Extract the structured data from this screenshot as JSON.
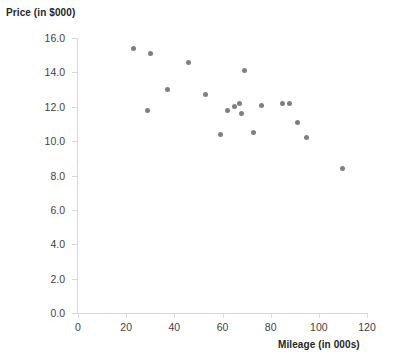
{
  "chart_data": {
    "type": "scatter",
    "title": "",
    "xlabel": "Mileage (in 000s)",
    "ylabel": "Price (in $000)",
    "xlim": [
      0,
      120
    ],
    "ylim": [
      0.0,
      16.0
    ],
    "xticks": [
      "0",
      "20",
      "40",
      "60",
      "80",
      "100",
      "120"
    ],
    "xtick_values": [
      0,
      20,
      40,
      60,
      80,
      100,
      120
    ],
    "yticks": [
      "0.0",
      "2.0",
      "4.0",
      "6.0",
      "8.0",
      "10.0",
      "12.0",
      "14.0",
      "16.0"
    ],
    "ytick_values": [
      0.0,
      2.0,
      4.0,
      6.0,
      8.0,
      10.0,
      12.0,
      14.0,
      16.0
    ],
    "grid": false,
    "legend": false,
    "marker_color": "#7f7f7f",
    "axis_color": "#d9d9d9",
    "series": [
      {
        "name": "Used cars",
        "x": [
          23,
          30,
          29,
          37,
          46,
          53,
          59,
          62,
          65,
          67,
          68,
          69,
          73,
          76,
          85,
          88,
          91,
          95,
          110
        ],
        "y": [
          15.4,
          15.1,
          11.8,
          13.0,
          14.6,
          12.7,
          10.4,
          11.8,
          12.0,
          12.2,
          11.6,
          14.1,
          10.5,
          12.1,
          12.2,
          12.2,
          11.1,
          10.2,
          8.4
        ],
        "points": [
          {
            "x": 23,
            "y": 15.4
          },
          {
            "x": 30,
            "y": 15.1
          },
          {
            "x": 29,
            "y": 11.8
          },
          {
            "x": 37,
            "y": 13.0
          },
          {
            "x": 46,
            "y": 14.6
          },
          {
            "x": 53,
            "y": 12.7
          },
          {
            "x": 59,
            "y": 10.4
          },
          {
            "x": 62,
            "y": 11.8
          },
          {
            "x": 65,
            "y": 12.0
          },
          {
            "x": 67,
            "y": 12.2
          },
          {
            "x": 68,
            "y": 11.6
          },
          {
            "x": 69,
            "y": 14.1
          },
          {
            "x": 73,
            "y": 10.5
          },
          {
            "x": 76,
            "y": 12.1
          },
          {
            "x": 85,
            "y": 12.2
          },
          {
            "x": 88,
            "y": 12.2
          },
          {
            "x": 91,
            "y": 11.1
          },
          {
            "x": 95,
            "y": 10.2
          },
          {
            "x": 110,
            "y": 8.4
          }
        ]
      }
    ]
  }
}
